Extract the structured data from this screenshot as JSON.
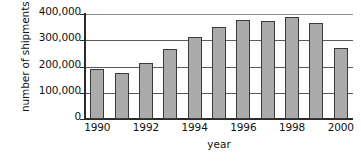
{
  "chart_data": {
    "type": "bar",
    "title": "",
    "xlabel": "year",
    "ylabel": "number of shipments",
    "categories": [
      "1990",
      "1991",
      "1992",
      "1993",
      "1994",
      "1995",
      "1996",
      "1997",
      "1998",
      "1999",
      "2000"
    ],
    "values": [
      190000,
      175000,
      215000,
      267000,
      312000,
      352000,
      377000,
      372000,
      389000,
      367000,
      270000
    ],
    "ylim": [
      0,
      400000
    ],
    "ytick_values": [
      0,
      100000,
      200000,
      300000,
      400000
    ],
    "ytick_labels": [
      "0",
      "100,000",
      "200,000",
      "300,000",
      "400,000"
    ],
    "xtick_labels": [
      "1990",
      "1992",
      "1994",
      "1996",
      "1998",
      "2000"
    ],
    "xtick_label_indices": [
      0,
      2,
      4,
      6,
      8,
      10
    ],
    "grid": "horizontal",
    "legend": "none",
    "bar_color": "#ababab",
    "bar_edge_color": "#3a3a3a",
    "axis_color": "#2b2b2b",
    "grid_color": "#5a5a5a"
  }
}
